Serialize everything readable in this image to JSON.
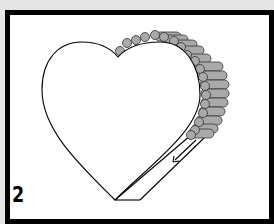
{
  "diagram": {
    "step_number": "2",
    "shape": "heart",
    "bead_color": "#a9a9a9",
    "frame_color": "#000000",
    "background_color": "#e6e6e6",
    "arrow_direction": "down-left along ribbon"
  }
}
